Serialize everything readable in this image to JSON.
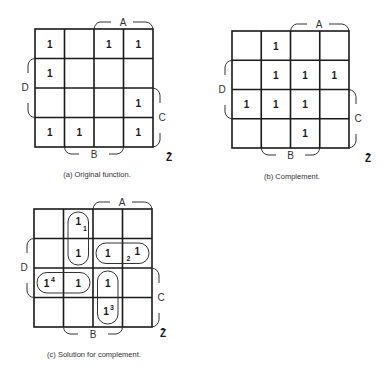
{
  "maps": [
    {
      "id": "a",
      "caption": "(a) Original function.",
      "variable_labels": {
        "top": "A",
        "left": "D",
        "right": "C",
        "bottom": "B",
        "corner": "Z̄"
      },
      "cells": [
        [
          "1",
          "",
          "1",
          "1"
        ],
        [
          "1",
          "",
          "",
          ""
        ],
        [
          "",
          "",
          "",
          "1"
        ],
        [
          "1",
          "1",
          "",
          "1"
        ]
      ]
    },
    {
      "id": "b",
      "caption": "(b) Complement.",
      "variable_labels": {
        "top": "A",
        "left": "D",
        "right": "C",
        "bottom": "B",
        "corner": "Z̄"
      },
      "cells": [
        [
          "",
          "1",
          "",
          ""
        ],
        [
          "",
          "1",
          "1",
          "1"
        ],
        [
          "1",
          "1",
          "1",
          ""
        ],
        [
          "",
          "",
          "1",
          ""
        ]
      ]
    },
    {
      "id": "c",
      "caption": "(c) Solution for complement.",
      "variable_labels": {
        "top": "A",
        "left": "D",
        "right": "C",
        "bottom": "B",
        "corner": "Z̄"
      },
      "cells": [
        [
          "",
          "1",
          "",
          ""
        ],
        [
          "",
          "1",
          "1",
          "1"
        ],
        [
          "1",
          "1",
          "1",
          ""
        ],
        [
          "",
          "",
          "1",
          ""
        ]
      ],
      "loops": [
        {
          "number": "1",
          "cells": [
            [
              0,
              1
            ],
            [
              1,
              1
            ]
          ],
          "orientation": "vertical"
        },
        {
          "number": "2",
          "cells": [
            [
              1,
              2
            ],
            [
              1,
              3
            ]
          ],
          "orientation": "horizontal"
        },
        {
          "number": "3",
          "cells": [
            [
              2,
              2
            ],
            [
              3,
              2
            ]
          ],
          "orientation": "vertical"
        },
        {
          "number": "4",
          "cells": [
            [
              2,
              0
            ],
            [
              2,
              1
            ]
          ],
          "orientation": "horizontal"
        }
      ]
    }
  ]
}
